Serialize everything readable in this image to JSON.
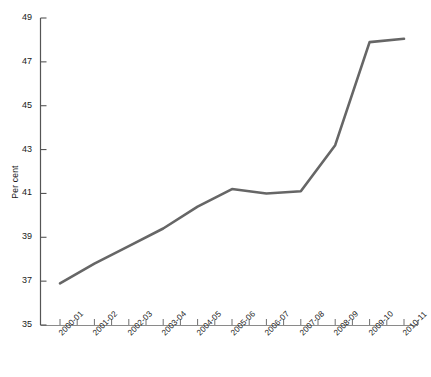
{
  "chart_data": {
    "type": "line",
    "title": "",
    "xlabel": "",
    "ylabel": "Per cent",
    "ylim": [
      35,
      49
    ],
    "ytick_labels": [
      "49",
      "47",
      "45",
      "43",
      "41",
      "39",
      "37",
      "35"
    ],
    "ytick_values": [
      49,
      47,
      45,
      43,
      41,
      39,
      37,
      35
    ],
    "grid": false,
    "legend": "none",
    "line_color": "#666666",
    "axis_color": "#555555",
    "categories": [
      "2000-01",
      "2001-02",
      "2002-03",
      "2003-04",
      "2004-05",
      "2005-06",
      "2006-07",
      "2007-08",
      "2008-09",
      "2009-10",
      "2010-11"
    ],
    "values": [
      36.9,
      37.8,
      38.6,
      39.4,
      40.4,
      41.2,
      41.0,
      41.1,
      43.2,
      47.9,
      48.05
    ]
  }
}
